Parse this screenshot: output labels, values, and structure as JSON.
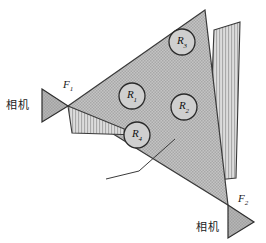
{
  "figure": {
    "type": "geometry-camera-coverage-diagram",
    "background": "#ffffff",
    "width": 266,
    "height": 243
  },
  "colors": {
    "plane_fill": "#b9b9b9",
    "plane_stroke": "#3a3a3a",
    "stripe_fill": "#d2d2d2",
    "stripe_line": "#8e8e8e",
    "stripe_stroke": "#3a3a3a",
    "camera_fill": "#b0b0b0",
    "camera_stroke": "#2e2e2e",
    "circle_fill": "#cfcfcf",
    "circle_stroke": "#2a2a2a",
    "leader_line": "#3a3a3a",
    "text": "#1a1a1a"
  },
  "cameras": [
    {
      "id": "camera-left",
      "label": "相机",
      "label_x": 6,
      "label_y": 100,
      "focus_label": "F",
      "focus_sub": "1",
      "focus_x": 63,
      "focus_y": 79,
      "triangle": "42,89 68,106 42,122",
      "orientation": "right"
    },
    {
      "id": "camera-bottom-right",
      "label": "相机",
      "label_x": 196,
      "label_y": 222,
      "focus_label": "F",
      "focus_sub": "2",
      "focus_x": 238,
      "focus_y": 193,
      "triangle": "228,205 254,222 228,238",
      "orientation": "right"
    }
  ],
  "plane": {
    "name": "target-plane",
    "points": "205,10 68,106 228,205"
  },
  "view_wedges": [
    {
      "id": "wedge-left",
      "name": "left-camera-view-wedge",
      "points": "68,106 139,135 72,133"
    },
    {
      "id": "wedge-right",
      "name": "right-camera-view-wedge",
      "points": "214,30 240,22 236,178 208,181"
    }
  ],
  "regions": [
    {
      "id": "R1",
      "label": "R",
      "sub": "1",
      "cx": 132,
      "cy": 96,
      "r": 13
    },
    {
      "id": "R2",
      "label": "R",
      "sub": "2",
      "cx": 184,
      "cy": 107,
      "r": 13
    },
    {
      "id": "R3",
      "label": "R",
      "sub": "3",
      "cx": 182,
      "cy": 42,
      "r": 13
    },
    {
      "id": "R4",
      "label": "R",
      "sub": "4",
      "cx": 137,
      "cy": 135,
      "r": 13
    }
  ],
  "leader_line": {
    "name": "annotation-leader-line",
    "x1": 139,
    "y1": 171,
    "x2": 175,
    "y2": 139,
    "tick_x1": 139,
    "tick_y1": 171,
    "tick_x2": 106,
    "tick_y2": 179
  }
}
